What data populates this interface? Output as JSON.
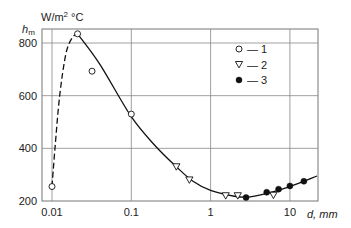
{
  "chart_data": {
    "type": "scatter",
    "title": "",
    "xlabel": "d, mm",
    "ylabel": "h_m",
    "ylabel_unit": "W/m² °C",
    "xscale": "log",
    "xlim": [
      0.01,
      30
    ],
    "ylim": [
      200,
      850
    ],
    "x_ticks": [
      0.01,
      0.1,
      1,
      10
    ],
    "x_tick_labels": [
      "0.01",
      "0.1",
      "1",
      "10"
    ],
    "y_ticks": [
      200,
      400,
      600,
      800
    ],
    "y_tick_labels": [
      "200",
      "400",
      "600",
      "800"
    ],
    "grid": true,
    "legend_position": "upper right (inside)",
    "series": [
      {
        "name": "1",
        "marker": "open-circle",
        "points": [
          {
            "x": 0.01,
            "y": 255
          },
          {
            "x": 0.021,
            "y": 835
          },
          {
            "x": 0.032,
            "y": 693
          },
          {
            "x": 0.1,
            "y": 530
          }
        ]
      },
      {
        "name": "2",
        "marker": "open-triangle-down",
        "points": [
          {
            "x": 0.37,
            "y": 330
          },
          {
            "x": 0.54,
            "y": 280
          },
          {
            "x": 1.55,
            "y": 220
          },
          {
            "x": 2.2,
            "y": 220
          },
          {
            "x": 6.2,
            "y": 222
          }
        ]
      },
      {
        "name": "3",
        "marker": "filled-circle",
        "points": [
          {
            "x": 2.8,
            "y": 213
          },
          {
            "x": 5.1,
            "y": 233
          },
          {
            "x": 7.2,
            "y": 245
          },
          {
            "x": 10,
            "y": 257
          },
          {
            "x": 15,
            "y": 275
          }
        ]
      }
    ],
    "curves": [
      {
        "name": "dashed-fit",
        "style": "dashed",
        "points": [
          {
            "x": 0.01,
            "y": 255
          },
          {
            "x": 0.0109,
            "y": 400
          },
          {
            "x": 0.0125,
            "y": 600
          },
          {
            "x": 0.015,
            "y": 760
          },
          {
            "x": 0.018,
            "y": 820
          },
          {
            "x": 0.021,
            "y": 835
          }
        ]
      },
      {
        "name": "solid-fit",
        "style": "solid",
        "points": [
          {
            "x": 0.021,
            "y": 835
          },
          {
            "x": 0.04,
            "y": 720
          },
          {
            "x": 0.1,
            "y": 520
          },
          {
            "x": 0.2,
            "y": 410
          },
          {
            "x": 0.37,
            "y": 330
          },
          {
            "x": 0.6,
            "y": 275
          },
          {
            "x": 1.0,
            "y": 240
          },
          {
            "x": 2.0,
            "y": 218
          },
          {
            "x": 3.0,
            "y": 215
          },
          {
            "x": 5.0,
            "y": 228
          },
          {
            "x": 10,
            "y": 255
          },
          {
            "x": 22,
            "y": 295
          }
        ]
      }
    ]
  },
  "axes": {
    "y_symbol": "h",
    "y_subscript": "m",
    "y_unit_base": "W/m",
    "y_unit_sup": "2",
    "y_unit_tail": " °C",
    "x_label": "d, mm"
  },
  "legend": [
    {
      "marker": "open-circle",
      "label": "— 1"
    },
    {
      "marker": "open-triangle-down",
      "label": "— 2"
    },
    {
      "marker": "filled-circle",
      "label": "— 3"
    }
  ]
}
